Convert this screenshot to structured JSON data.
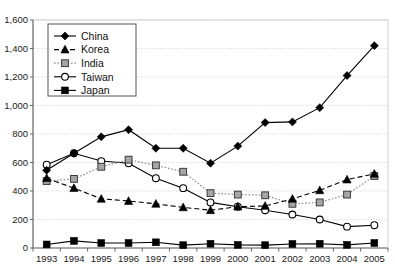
{
  "chart_data": {
    "type": "line",
    "title": "",
    "xlabel": "",
    "ylabel": "",
    "grid": true,
    "legend_position": "top-left-inside",
    "categories": [
      "1993",
      "1994",
      "1995",
      "1996",
      "1997",
      "1998",
      "1999",
      "2000",
      "2001",
      "2002",
      "2003",
      "2004",
      "2005"
    ],
    "x": [
      1993,
      1994,
      1995,
      1996,
      1997,
      1998,
      1999,
      2000,
      2001,
      2002,
      2003,
      2004,
      2005
    ],
    "ylim": [
      0,
      1600
    ],
    "yticks": [
      0,
      200,
      400,
      600,
      800,
      1000,
      1200,
      1400,
      1600
    ],
    "ytick_labels": [
      "0",
      "200",
      "400",
      "600",
      "800",
      "1,000",
      "1,200",
      "1,400",
      "1,600"
    ],
    "series": [
      {
        "name": "China",
        "marker": "filled-diamond",
        "line": "solid",
        "color": "#000000",
        "values": [
          545,
          665,
          780,
          830,
          700,
          700,
          595,
          715,
          880,
          885,
          985,
          1210,
          1420
        ]
      },
      {
        "name": "Korea",
        "marker": "filled-triangle",
        "line": "dashed",
        "color": "#000000",
        "values": [
          490,
          420,
          345,
          330,
          310,
          285,
          265,
          290,
          295,
          345,
          405,
          480,
          520
        ]
      },
      {
        "name": "India",
        "marker": "open-square",
        "line": "dotted",
        "color": "#8c8c8c",
        "values": [
          470,
          485,
          570,
          620,
          580,
          535,
          385,
          375,
          370,
          310,
          320,
          375,
          505
        ]
      },
      {
        "name": "Taiwan",
        "marker": "open-circle",
        "line": "solid",
        "color": "#000000",
        "values": [
          585,
          665,
          610,
          595,
          490,
          420,
          320,
          290,
          265,
          235,
          200,
          150,
          160
        ]
      },
      {
        "name": "Japan",
        "marker": "filled-square",
        "line": "solid",
        "color": "#000000",
        "values": [
          25,
          50,
          35,
          35,
          40,
          20,
          30,
          22,
          20,
          28,
          30,
          22,
          35
        ]
      }
    ]
  },
  "legend": {
    "items": [
      {
        "label": "China"
      },
      {
        "label": "Korea"
      },
      {
        "label": "India"
      },
      {
        "label": "Taiwan"
      },
      {
        "label": "Japan"
      }
    ]
  },
  "colors": {
    "axis": "#555555",
    "grid": "#cccccc",
    "plot_background": "#ffffff",
    "text": "#1a1a1a"
  }
}
